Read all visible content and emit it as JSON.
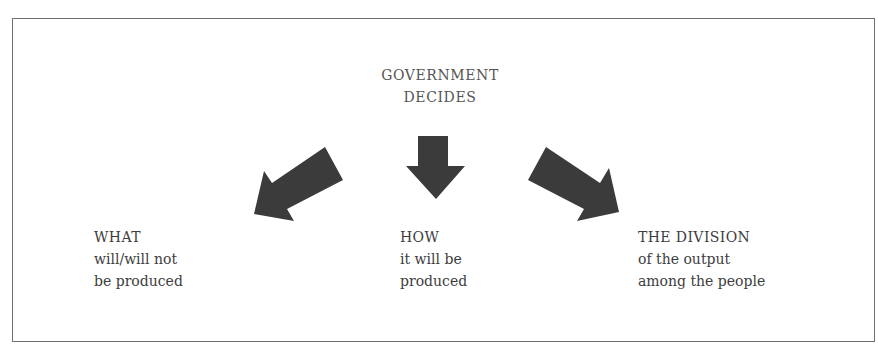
{
  "diagram": {
    "title": {
      "line1": "GOVERNMENT",
      "line2": "DECIDES"
    },
    "arrows": [
      {
        "name": "arrow-down-left",
        "direction": "down-left",
        "target": "what"
      },
      {
        "name": "arrow-down",
        "direction": "down",
        "target": "how"
      },
      {
        "name": "arrow-down-right",
        "direction": "down-right",
        "target": "division"
      }
    ],
    "arrow_color": "#3b3b3b",
    "border_color": "#6e6e6e",
    "outcomes": [
      {
        "heading": "WHAT",
        "line1": "will/will not",
        "line2": "be produced"
      },
      {
        "heading": "HOW",
        "line1": "it will be",
        "line2": "produced"
      },
      {
        "heading": "THE DIVISION",
        "line1": "of the output",
        "line2": "among the people"
      }
    ]
  }
}
